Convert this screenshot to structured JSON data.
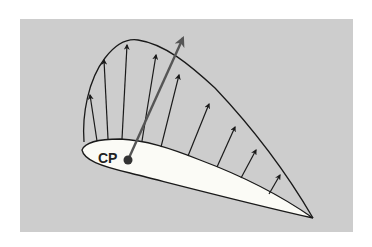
{
  "diagram": {
    "cp_label": "CP",
    "colors": {
      "background": "#cdcdcd",
      "airfoil_fill": "#fbfbf6",
      "stroke": "#1a1a1a",
      "resultant": "#555555"
    },
    "pressure_arrows": [
      {
        "x1": 97,
        "y1": 141,
        "x2": 90,
        "y2": 95
      },
      {
        "x1": 108,
        "y1": 139,
        "x2": 104,
        "y2": 60
      },
      {
        "x1": 122,
        "y1": 139,
        "x2": 127,
        "y2": 45
      },
      {
        "x1": 142,
        "y1": 141,
        "x2": 156,
        "y2": 55
      },
      {
        "x1": 161,
        "y1": 147,
        "x2": 179,
        "y2": 75
      },
      {
        "x1": 188,
        "y1": 156,
        "x2": 209,
        "y2": 104
      },
      {
        "x1": 217,
        "y1": 167,
        "x2": 235,
        "y2": 127
      },
      {
        "x1": 241,
        "y1": 178,
        "x2": 256,
        "y2": 150
      },
      {
        "x1": 269,
        "y1": 194,
        "x2": 280,
        "y2": 175
      }
    ],
    "resultant_arrow": {
      "x1": 128,
      "y1": 160,
      "x2": 183,
      "y2": 38
    }
  }
}
